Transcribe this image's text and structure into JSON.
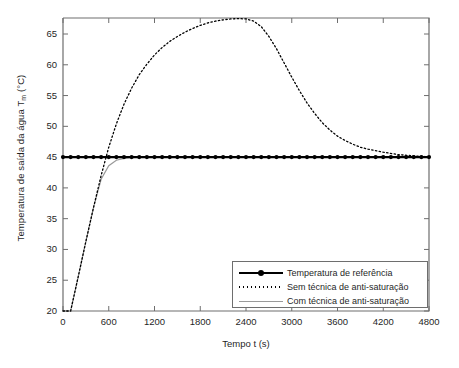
{
  "chart_data": {
    "type": "line",
    "title": "",
    "xlabel": "Tempo t (s)",
    "ylabel_text": "Temperatura de saída da água T",
    "ylabel_sub": "m",
    "ylabel_unit": " (°C)",
    "xlim": [
      0,
      4800
    ],
    "ylim": [
      20,
      67.6
    ],
    "xticks": [
      0,
      600,
      1200,
      1800,
      2400,
      3000,
      3600,
      4200,
      4800
    ],
    "xticklabels": [
      "0",
      "600",
      "1200",
      "1800",
      "2400",
      "3000",
      "3600",
      "4200",
      "4800"
    ],
    "yticks": [
      20,
      25,
      30,
      35,
      40,
      45,
      50,
      55,
      60,
      65
    ],
    "yticklabels": [
      "20",
      "25",
      "30",
      "35",
      "40",
      "45",
      "50",
      "55",
      "60",
      "65"
    ],
    "grid": false,
    "legend_position": "lower right",
    "series": [
      {
        "name": "Temperatura de referência",
        "style": "solid-with-markers",
        "color": "#000000",
        "x": [
          0,
          4800
        ],
        "values": [
          45,
          45
        ],
        "marker_spacing": 100
      },
      {
        "name": "Sem técnica de anti-saturação",
        "style": "dotted",
        "color": "#000000",
        "x": [
          0,
          100,
          200,
          300,
          400,
          500,
          600,
          700,
          800,
          900,
          1000,
          1100,
          1200,
          1300,
          1400,
          1500,
          1600,
          1700,
          1800,
          1900,
          2000,
          2100,
          2200,
          2300,
          2400,
          2500,
          2600,
          2700,
          2800,
          2900,
          3000,
          3100,
          3200,
          3300,
          3400,
          3500,
          3600,
          3700,
          3800,
          3900,
          4000,
          4200,
          4400,
          4600,
          4800
        ],
        "values": [
          20,
          20,
          25.6,
          31.3,
          36.8,
          42.0,
          46.6,
          50.4,
          53.6,
          56.2,
          58.4,
          60.1,
          61.6,
          62.8,
          63.8,
          64.6,
          65.3,
          65.9,
          66.4,
          66.8,
          67.1,
          67.3,
          67.45,
          67.5,
          67.45,
          67.1,
          66.2,
          64.6,
          62.6,
          60.3,
          58.0,
          55.8,
          53.8,
          52.1,
          50.6,
          49.4,
          48.4,
          47.7,
          47.1,
          46.6,
          46.3,
          45.8,
          45.4,
          45.2,
          45.05
        ]
      },
      {
        "name": "Com técnica de anti-saturação",
        "style": "solid-gray",
        "color": "#9a9a9a",
        "x": [
          0,
          100,
          200,
          300,
          400,
          500,
          600,
          700,
          800,
          900,
          1000,
          1200,
          1800,
          2400,
          3000,
          3600,
          4200,
          4800
        ],
        "values": [
          20,
          20,
          25.6,
          31.3,
          36.8,
          41.4,
          43.6,
          44.5,
          44.8,
          44.95,
          45,
          45,
          45,
          45,
          45,
          45,
          45,
          45
        ]
      }
    ],
    "annotations": {
      "peak_value": 67.5,
      "peak_time": 2350,
      "reference_value": 45,
      "start_value": 20,
      "rise_start_time": 100
    }
  }
}
